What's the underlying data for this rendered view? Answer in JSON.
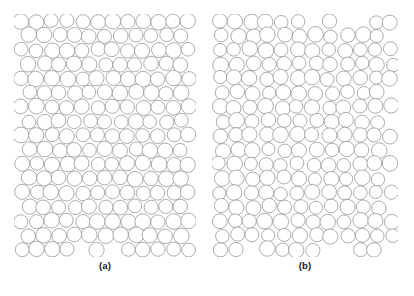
{
  "figure": {
    "type": "scientific-figure",
    "background_color": "#ffffff",
    "circle_fill": "#ffffff",
    "circle_stroke": "#8a8a8a",
    "circle_stroke_width": 0.7
  },
  "panels": [
    {
      "id": "a",
      "caption": "(a)",
      "packing_type": "hexagonal-disordered",
      "nominal_radius": 7.35,
      "radius_jitter": 0.55,
      "position_jitter": 1.05,
      "rows": 17,
      "columns": 12,
      "row_offset_alternating": 0.5,
      "circle_count": 204,
      "seed": 20347
    },
    {
      "id": "b",
      "caption": "(b)",
      "packing_type": "square-disordered",
      "nominal_radius": 7.2,
      "radius_jitter": 0.7,
      "position_jitter": 1.45,
      "rows": 17,
      "columns": 12,
      "row_offset_alternating": 0.18,
      "circle_count": 204,
      "seed": 91733
    }
  ],
  "captions": {
    "panel_a_label": "(a)",
    "panel_b_label": "(b)"
  },
  "chart_data": {
    "type": "scatter",
    "title": "",
    "xlabel": "",
    "ylabel": "",
    "grid": false,
    "legend": "none",
    "series": [
      {
        "name": "(a) hexagonal-like disk packing",
        "marker": "open-circle",
        "rows": 17,
        "columns": 12,
        "count": 204,
        "mean_radius": 7.35
      },
      {
        "name": "(b) square-like disk packing",
        "marker": "open-circle",
        "rows": 17,
        "columns": 12,
        "count": 204,
        "mean_radius": 7.2
      }
    ]
  }
}
